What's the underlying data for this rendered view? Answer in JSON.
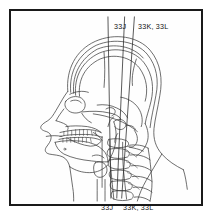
{
  "figure": {
    "type": "patent-line-drawing",
    "background_color": "#ffffff",
    "line_color": "#333333",
    "frame_color": "#1a1a1a"
  },
  "labels": {
    "top_left": "33J",
    "top_right": "33K, 33L",
    "bottom_left": "33J",
    "bottom_right": "33K, 33L"
  },
  "leader_lines": {
    "count": 3,
    "orientation": "vertical",
    "description": "three near-vertical reference lines spanning the figure from the upper labels to the lower labels"
  },
  "anatomy": {
    "parts": [
      "soft-tissue head outline",
      "cranial vault",
      "frontal bone",
      "orbit",
      "nasal bone",
      "maxilla",
      "upper teeth",
      "lower teeth",
      "mandible",
      "skull base",
      "cervical vertebrae",
      "spinous processes",
      "posterior neck contour",
      "shoulder line"
    ]
  }
}
